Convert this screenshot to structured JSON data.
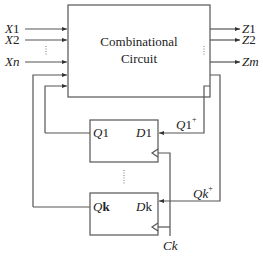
{
  "combinational_block": {
    "line1": "Combinational",
    "line2": "Circuit"
  },
  "inputs": [
    {
      "var": "X",
      "sub": "1"
    },
    {
      "var": "X",
      "sub": "2"
    },
    {
      "var": "X",
      "sub": "n"
    }
  ],
  "outputs": [
    {
      "var": "Z",
      "sub": "1"
    },
    {
      "var": "Z",
      "sub": "2"
    },
    {
      "var": "Z",
      "sub": "m"
    }
  ],
  "flipflops": [
    {
      "q_var": "Q",
      "q_sub": "1",
      "d_var": "D",
      "d_sub": "1",
      "next_var": "Q",
      "next_sub": "1",
      "next_sup": "+"
    },
    {
      "q_var": "Q",
      "q_sub": "k",
      "d_var": "D",
      "d_sub": "k",
      "next_var": "Q",
      "next_sub": "k",
      "next_sup": "+"
    }
  ],
  "clock": {
    "label": "Ck"
  }
}
